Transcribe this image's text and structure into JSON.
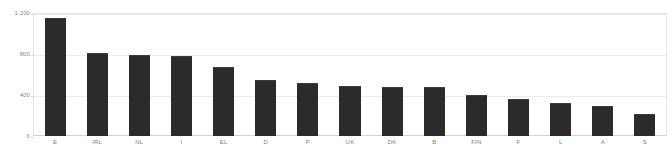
{
  "chart_data": {
    "type": "bar",
    "title": "",
    "subtitle": "",
    "xlabel": "",
    "ylabel": "",
    "categories": [
      "E",
      "IRL",
      "NL",
      "I",
      "EL",
      "D",
      "P",
      "UK",
      "DK",
      "B",
      "FIN",
      "F",
      "L",
      "A",
      "S"
    ],
    "values": [
      1160,
      820,
      800,
      790,
      680,
      555,
      520,
      490,
      480,
      480,
      400,
      360,
      320,
      295,
      215
    ],
    "series": [
      {
        "name": "",
        "values": [
          1160,
          820,
          800,
          790,
          680,
          555,
          520,
          490,
          480,
          480,
          400,
          360,
          320,
          295,
          215
        ]
      }
    ],
    "ylim": [
      0,
      1200
    ],
    "yticks": [
      0,
      400,
      800,
      1200
    ],
    "ytick_labels": [
      "0",
      "400",
      "800",
      "1,200"
    ],
    "grid": true,
    "legend": "none",
    "bar_color": "#2b2b2b",
    "gridline_color": "#ececec",
    "frame_color": "#e3e3e3",
    "axis_text_color": "#8a8a8a",
    "background_color": "#ffffff"
  }
}
